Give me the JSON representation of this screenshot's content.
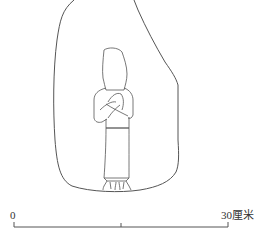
{
  "figure": {
    "stroke_color": "#555555"
  },
  "scale_bar": {
    "start_label": "0",
    "end_label": "30厘米",
    "length_value": 30,
    "unit": "厘米"
  }
}
